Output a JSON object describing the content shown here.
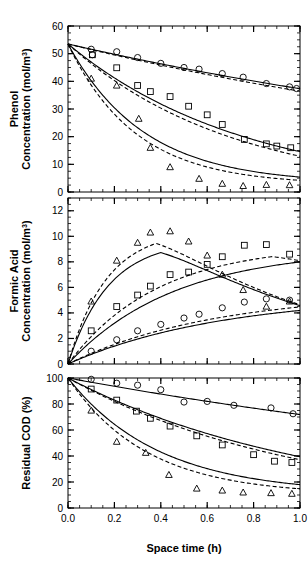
{
  "figure": {
    "panels": [
      "phenol",
      "formic_acid",
      "residual_cod"
    ],
    "xlabel": "Space time (h)",
    "series_markers": [
      "circle",
      "square",
      "triangle"
    ]
  },
  "chart_data": [
    {
      "type": "scatter",
      "panel": "phenol",
      "title": "",
      "xlabel": "Space time (h)",
      "ylabel": "Phenol Concentration (mol/m3)",
      "ylabel_main": "Phenol",
      "ylabel_sub": "Concentration (mol/m",
      "ylabel_exp": "3",
      "ylabel_tail": ")",
      "xlim": [
        0.0,
        1.0
      ],
      "ylim": [
        0,
        60
      ],
      "xticks": [
        0.0,
        0.2,
        0.4,
        0.6,
        0.8,
        1.0
      ],
      "xticklabels": [
        "",
        "",
        "",
        "",
        "",
        ""
      ],
      "yticks": [
        0,
        10,
        20,
        30,
        40,
        50,
        60
      ],
      "yticklabels": [
        "0",
        "10",
        "20",
        "30",
        "40",
        "50",
        "60"
      ],
      "minor_tick_step_x": 0.05,
      "minor_tick_step_y": 2.5,
      "grid": false,
      "legend": null,
      "series": [
        {
          "name": "circle-data",
          "marker": "circle",
          "x": [
            0.1,
            0.105,
            0.21,
            0.3,
            0.4,
            0.5,
            0.565,
            0.665,
            0.755,
            0.855,
            0.955,
            0.985
          ],
          "y": [
            51.6,
            49.6,
            50.7,
            48.6,
            46.5,
            45.0,
            44.4,
            42.8,
            41.5,
            39.2,
            38.0,
            37.4
          ]
        },
        {
          "name": "square-data",
          "marker": "square",
          "x": [
            0.105,
            0.21,
            0.3,
            0.355,
            0.44,
            0.52,
            0.6,
            0.665,
            0.76,
            0.855,
            0.9,
            0.96
          ],
          "y": [
            49.6,
            44.9,
            38.5,
            36.3,
            34.5,
            31.0,
            27.9,
            24.4,
            19.0,
            17.4,
            16.6,
            16.0
          ]
        },
        {
          "name": "triangle-data",
          "marker": "triangle",
          "x": [
            0.1,
            0.21,
            0.305,
            0.355,
            0.44,
            0.565,
            0.665,
            0.755,
            0.855,
            0.955
          ],
          "y": [
            41.0,
            38.5,
            26.5,
            16.0,
            9.0,
            4.8,
            3.0,
            2.2,
            2.6,
            2.5
          ]
        }
      ],
      "model_curves": [
        {
          "name": "circle-solid",
          "style": "solid",
          "c0": 53.5,
          "k": 0.36,
          "floor": 0.0
        },
        {
          "name": "circle-dashed",
          "style": "dashed",
          "c0": 53.5,
          "k": 0.385,
          "floor": 0.0
        },
        {
          "name": "square-solid",
          "style": "solid",
          "c0": 53.5,
          "k": 1.3,
          "floor": 0.0
        },
        {
          "name": "square-dashed",
          "style": "dashed",
          "c0": 53.5,
          "k": 1.42,
          "floor": 0.0
        },
        {
          "name": "triangle-solid",
          "style": "solid",
          "c0": 53.5,
          "k": 3.05,
          "floor": 3.0
        },
        {
          "name": "triangle-dashed",
          "style": "dashed",
          "c0": 53.5,
          "k": 3.45,
          "floor": 2.6
        }
      ]
    },
    {
      "type": "scatter",
      "panel": "formic_acid",
      "title": "",
      "xlabel": "Space time (h)",
      "ylabel": "Formic Acid Concentration (mol/m3)",
      "ylabel_main": "Formic Acid",
      "ylabel_sub": "Concentration (mol/m",
      "ylabel_exp": "3",
      "ylabel_tail": ")",
      "xlim": [
        0.0,
        1.0
      ],
      "ylim": [
        0,
        13
      ],
      "xticks": [
        0.0,
        0.2,
        0.4,
        0.6,
        0.8,
        1.0
      ],
      "xticklabels": [
        "",
        "",
        "",
        "",
        "",
        ""
      ],
      "yticks": [
        0,
        2,
        4,
        6,
        8,
        10,
        12
      ],
      "yticklabels": [
        "0",
        "2",
        "4",
        "6",
        "8",
        "10",
        "12"
      ],
      "minor_tick_step_x": 0.05,
      "minor_tick_step_y": 0.5,
      "grid": false,
      "legend": null,
      "series": [
        {
          "name": "circle-data",
          "marker": "circle",
          "x": [
            0.1,
            0.21,
            0.3,
            0.4,
            0.5,
            0.565,
            0.665,
            0.76,
            0.855,
            0.955
          ],
          "y": [
            1.0,
            1.9,
            2.6,
            3.1,
            3.6,
            3.9,
            4.4,
            4.85,
            5.1,
            5.0
          ]
        },
        {
          "name": "square-data",
          "marker": "square",
          "x": [
            0.1,
            0.21,
            0.3,
            0.355,
            0.44,
            0.52,
            0.6,
            0.665,
            0.76,
            0.855,
            0.955
          ],
          "y": [
            2.6,
            4.5,
            5.4,
            6.1,
            7.0,
            7.2,
            7.8,
            8.4,
            9.3,
            9.35,
            8.6
          ]
        },
        {
          "name": "triangle-data",
          "marker": "triangle",
          "x": [
            0.1,
            0.21,
            0.3,
            0.355,
            0.44,
            0.52,
            0.6,
            0.665,
            0.755,
            0.855,
            0.955
          ],
          "y": [
            4.9,
            8.1,
            9.5,
            10.3,
            10.4,
            9.6,
            8.5,
            7.0,
            5.8,
            4.5,
            4.9
          ]
        }
      ],
      "model_curves": [
        {
          "name": "circle-solid",
          "style": "solid",
          "a": 5.4,
          "k": 1.5,
          "p": 1.0
        },
        {
          "name": "circle-dashed",
          "style": "dashed",
          "a": 5.6,
          "k": 1.6,
          "p": 1.0
        },
        {
          "name": "square-solid",
          "style": "solid",
          "peak": 9.0,
          "tpeak": 1.05
        },
        {
          "name": "square-dashed",
          "style": "dashed",
          "peak": 9.35,
          "tpeak": 0.88
        },
        {
          "name": "triangle-solid",
          "style": "solid",
          "peak": 9.7,
          "tpeak": 0.4
        },
        {
          "name": "triangle-dashed",
          "style": "dashed",
          "peak": 10.5,
          "tpeak": 0.38
        }
      ]
    },
    {
      "type": "scatter",
      "panel": "residual_cod",
      "title": "",
      "xlabel": "Space time (h)",
      "ylabel": "Residual COD (%)",
      "ylabel_main": "Residual COD (%)",
      "xlim": [
        0.0,
        1.0
      ],
      "ylim": [
        0,
        100
      ],
      "xticks": [
        0.0,
        0.2,
        0.4,
        0.6,
        0.8,
        1.0
      ],
      "xticklabels": [
        "0.0",
        "0.2",
        "0.4",
        "0.6",
        "0.8",
        "1.0"
      ],
      "yticks": [
        0,
        20,
        40,
        60,
        80,
        100
      ],
      "yticklabels": [
        "0",
        "20",
        "40",
        "60",
        "80",
        "100"
      ],
      "minor_tick_step_x": 0.05,
      "minor_tick_step_y": 5,
      "grid": false,
      "legend": null,
      "series": [
        {
          "name": "circle-data",
          "marker": "circle",
          "x": [
            0.1,
            0.21,
            0.3,
            0.4,
            0.5,
            0.6,
            0.715,
            0.875,
            0.97
          ],
          "y": [
            99.0,
            96.0,
            94.5,
            91.0,
            81.5,
            82.0,
            79.0,
            77.0,
            72.5
          ]
        },
        {
          "name": "square-data",
          "marker": "square",
          "x": [
            0.1,
            0.21,
            0.295,
            0.355,
            0.44,
            0.555,
            0.665,
            0.8,
            0.89,
            0.965
          ],
          "y": [
            91.5,
            83.0,
            74.5,
            69.0,
            63.0,
            55.5,
            48.5,
            41.0,
            36.0,
            35.0
          ]
        },
        {
          "name": "triangle-data",
          "marker": "triangle",
          "x": [
            0.1,
            0.21,
            0.335,
            0.435,
            0.555,
            0.665,
            0.755,
            0.875,
            0.965
          ],
          "y": [
            75.0,
            51.0,
            42.5,
            25.5,
            15.0,
            13.5,
            12.0,
            11.5,
            11.0
          ]
        }
      ],
      "model_curves": [
        {
          "name": "circle-solid",
          "style": "solid",
          "c0": 100,
          "k": 0.33,
          "floor": 0.0
        },
        {
          "name": "square-solid",
          "style": "solid",
          "c0": 100,
          "k": 0.93,
          "floor": 0.0
        },
        {
          "name": "square-dashed",
          "style": "dashed",
          "c0": 100,
          "k": 0.99,
          "floor": 0.0
        },
        {
          "name": "triangle-solid",
          "style": "solid",
          "c0": 100,
          "k": 2.55,
          "floor": 11.0
        },
        {
          "name": "triangle-dashed",
          "style": "dashed",
          "c0": 100,
          "k": 2.95,
          "floor": 10.0
        }
      ]
    }
  ]
}
